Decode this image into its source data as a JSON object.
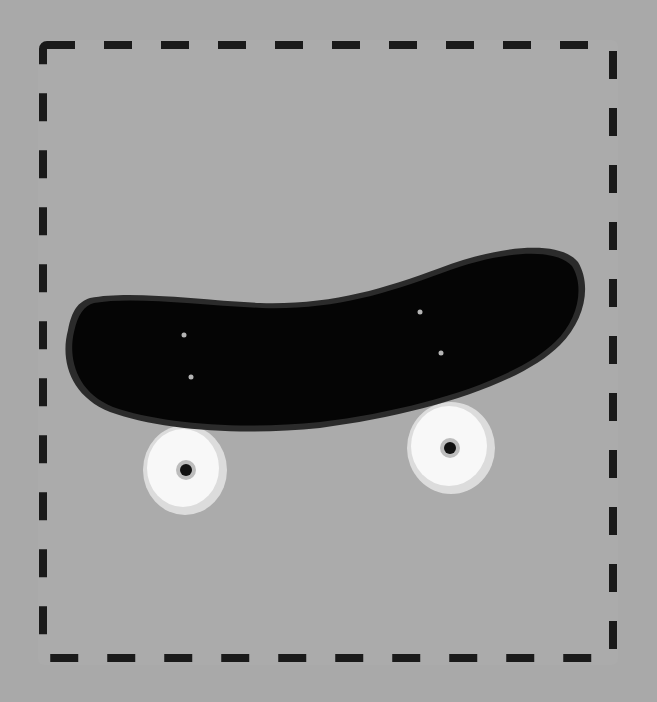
{
  "scene": {
    "subject": "skateboard",
    "colors": {
      "background": "#a9a9a9",
      "card": "#ababab",
      "dash": "#1a1a1a",
      "deck": "#050505",
      "deck_edge": "#2a2a2a",
      "wheel": "#f7f7f7",
      "wheel_rim": "#dddddd",
      "hub": "#111111",
      "bolt": "#b5b5b5"
    }
  }
}
